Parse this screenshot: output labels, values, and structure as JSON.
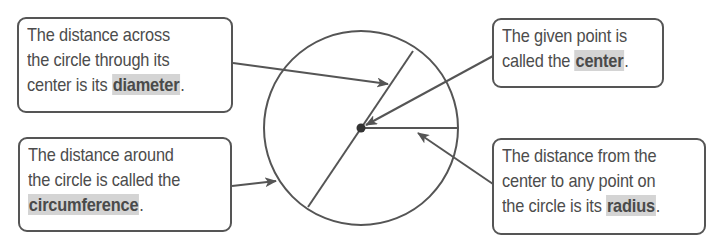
{
  "diagram": {
    "colors": {
      "stroke": "#555555",
      "highlight": "#d4d4d4",
      "text": "#4c4c4c"
    },
    "callouts": [
      {
        "id": "diameter",
        "lines": [
          "The distance across",
          "the circle through its",
          "center is its "
        ],
        "term": "diameter",
        "suffix": "."
      },
      {
        "id": "circumference",
        "lines": [
          "The distance around",
          "the circle is called the",
          ""
        ],
        "term": "circumference",
        "suffix": "."
      },
      {
        "id": "center",
        "lines": [
          "The given point is",
          "called the "
        ],
        "term": "center",
        "suffix": "."
      },
      {
        "id": "radius",
        "lines": [
          "The distance from the",
          "center to any point on",
          "the circle is its "
        ],
        "term": "radius",
        "suffix": "."
      }
    ],
    "circle": {
      "cx": 361,
      "cy": 128,
      "r": 97
    }
  }
}
